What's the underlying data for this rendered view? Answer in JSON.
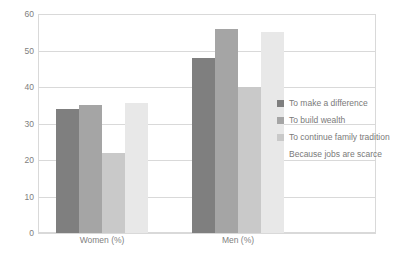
{
  "chart_data": {
    "type": "bar",
    "title": "",
    "subtitle": "",
    "xlabel": "",
    "ylabel": "",
    "categories": [
      "Women (%)",
      "Men (%)"
    ],
    "series": [
      {
        "name": "To make a difference",
        "color": "#7f7f7f",
        "values": [
          34,
          48
        ]
      },
      {
        "name": "To build wealth",
        "color": "#a5a5a5",
        "values": [
          35,
          56
        ]
      },
      {
        "name": "To continue family tradition",
        "color": "#c9c9c9",
        "values": [
          22,
          40
        ]
      },
      {
        "name": "Because jobs are scarce",
        "color": "#e8e8e8",
        "values": [
          35.5,
          55
        ]
      }
    ],
    "ylim": [
      0,
      60
    ],
    "yticks": [
      0,
      10,
      20,
      30,
      40,
      50,
      60
    ],
    "ytick_labels": [
      "0",
      "10",
      "20",
      "30",
      "40",
      "50",
      "60"
    ],
    "grid": true,
    "grid_axis": "y",
    "legend_position": "right",
    "plot_border_color": "#d9d9d9",
    "tick_label_color": "#808080",
    "legend_text_color": "#7a7a7a",
    "background": "#ffffff"
  }
}
